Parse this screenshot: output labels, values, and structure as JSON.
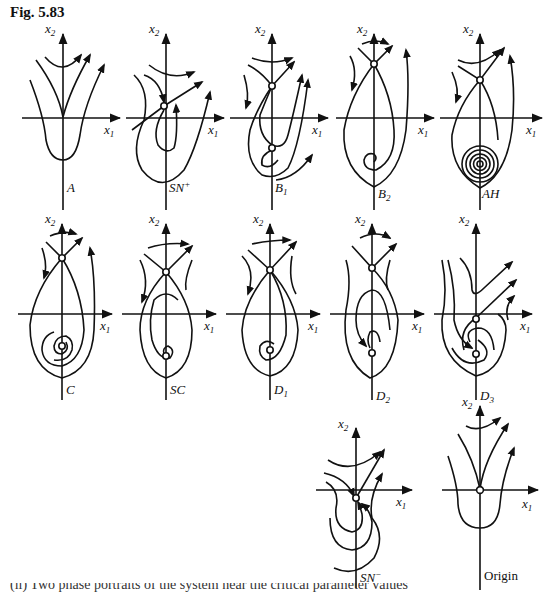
{
  "figure": {
    "title": "Fig. 5.83",
    "axis_labels": {
      "x": "x",
      "x_sub": "1",
      "y": "x",
      "y_sub": "2"
    },
    "panels": [
      {
        "id": "A",
        "label": "A"
      },
      {
        "id": "SN+",
        "label": "SN",
        "sup": "+"
      },
      {
        "id": "B1",
        "label": "B",
        "sub": "1"
      },
      {
        "id": "B2",
        "label": "B",
        "sub": "2"
      },
      {
        "id": "AH",
        "label": "AH"
      },
      {
        "id": "C",
        "label": "C"
      },
      {
        "id": "SC",
        "label": "SC"
      },
      {
        "id": "D1",
        "label": "D",
        "sub": "1"
      },
      {
        "id": "D2",
        "label": "D",
        "sub": "2"
      },
      {
        "id": "D3",
        "label": "D",
        "sub": "3"
      },
      {
        "id": "SN-",
        "label": "SN",
        "sup": "−"
      },
      {
        "id": "Origin",
        "label": "Origin"
      }
    ]
  },
  "caption_cut": "(ii) Two phase portraits of the system near the critical parameter values"
}
